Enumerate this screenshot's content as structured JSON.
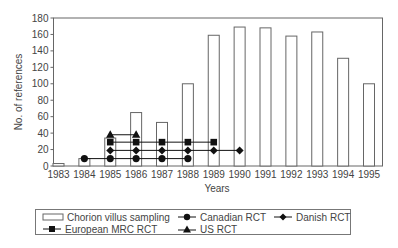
{
  "chart_data": {
    "type": "bar",
    "title": "",
    "xlabel": "Years",
    "ylabel": "No. of references",
    "ylim": [
      0,
      180
    ],
    "yticks": [
      0,
      20,
      40,
      60,
      80,
      100,
      120,
      140,
      160,
      180
    ],
    "categories": [
      "1983",
      "1984",
      "1985",
      "1986",
      "1987",
      "1988",
      "1989",
      "1990",
      "1991",
      "1992",
      "1993",
      "1994",
      "1995"
    ],
    "grid": false,
    "legend_position": "bottom",
    "series": [
      {
        "name": "Chorion villus sampling",
        "type": "bar",
        "marker": "open-rect",
        "values": [
          3,
          9,
          34,
          65,
          53,
          100,
          159,
          169,
          168,
          158,
          163,
          131,
          100
        ]
      },
      {
        "name": "Canadian RCT",
        "type": "line",
        "marker": "circle",
        "x": [
          "1984",
          "1985",
          "1986",
          "1987",
          "1988"
        ],
        "values": [
          9,
          9,
          9,
          9,
          9
        ]
      },
      {
        "name": "Danish RCT",
        "type": "line",
        "marker": "diamond",
        "x": [
          "1985",
          "1986",
          "1987",
          "1988",
          "1989",
          "1990"
        ],
        "values": [
          19,
          19,
          19,
          19,
          19,
          19
        ]
      },
      {
        "name": "European MRC RCT",
        "type": "line",
        "marker": "square",
        "x": [
          "1985",
          "1986",
          "1987",
          "1988",
          "1989"
        ],
        "values": [
          29,
          29,
          29,
          29,
          29
        ]
      },
      {
        "name": "US RCT",
        "type": "line",
        "marker": "triangle",
        "x": [
          "1985",
          "1986"
        ],
        "values": [
          38,
          38
        ]
      }
    ]
  },
  "legend": {
    "items": [
      {
        "label": "Chorion villus sampling",
        "marker": "open-rect"
      },
      {
        "label": "Canadian RCT",
        "marker": "circle"
      },
      {
        "label": "Danish RCT",
        "marker": "diamond"
      },
      {
        "label": "European MRC RCT",
        "marker": "square"
      },
      {
        "label": "US RCT",
        "marker": "triangle"
      }
    ]
  },
  "colors": {
    "axis": "#666666",
    "bar_stroke": "#666666",
    "marker": "#111111",
    "text": "#444444"
  }
}
